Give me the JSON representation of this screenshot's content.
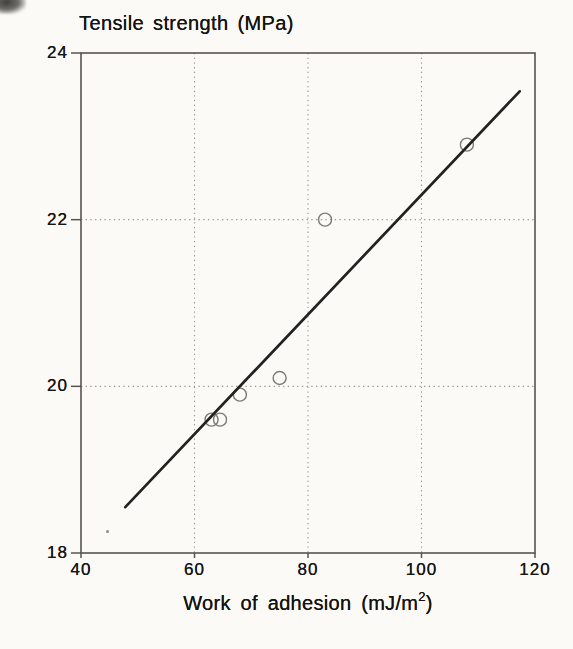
{
  "colors": {
    "background": "#fbfaf6",
    "axis": "#57544e",
    "grid": "#9b978e",
    "fit_line": "#222220",
    "marker": "#7e7b75",
    "text": "#161616"
  },
  "chart_data": {
    "type": "scatter",
    "title": "Tensile strength (MPa)",
    "xlabel": "Work of adhesion (mJ/m²)",
    "xlabel_parts": {
      "prefix": "Work of adhesion (mJ/m",
      "sup": "2",
      "suffix": ")"
    },
    "ylabel": "Tensile strength (MPa)",
    "xlim": [
      40,
      120
    ],
    "ylim": [
      18,
      24
    ],
    "x_ticks": [
      "40",
      "60",
      "80",
      "100",
      "120"
    ],
    "x_tick_values": [
      40,
      60,
      80,
      100,
      120
    ],
    "y_ticks": [
      "18",
      "20",
      "22",
      "24"
    ],
    "y_tick_values": [
      18,
      20,
      22,
      24
    ],
    "grid": {
      "style": "dotted",
      "x_values": [
        60,
        80,
        100
      ],
      "y_values": [
        20,
        22
      ]
    },
    "points": [
      {
        "x": 63,
        "y": 19.6
      },
      {
        "x": 64.5,
        "y": 19.6
      },
      {
        "x": 68,
        "y": 19.9
      },
      {
        "x": 75,
        "y": 20.1
      },
      {
        "x": 83,
        "y": 22.0
      },
      {
        "x": 108,
        "y": 22.9
      }
    ],
    "fit_line": {
      "x1": 47.8,
      "y1": 18.55,
      "x2": 117.3,
      "y2": 23.54
    },
    "marker_style": "open-circle",
    "legend": "none"
  }
}
